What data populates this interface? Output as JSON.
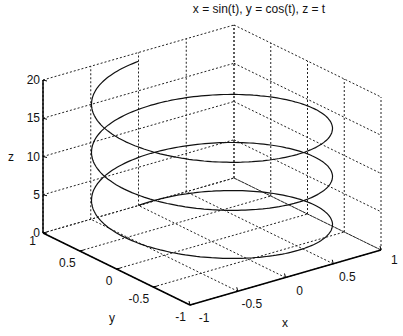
{
  "chart_data": {
    "type": "line3d",
    "title": "x = sin(t), y = cos(t), z = t",
    "xlabel": "x",
    "ylabel": "y",
    "zlabel": "z",
    "xlim": [
      -1,
      1
    ],
    "ylim": [
      -1,
      1
    ],
    "zlim": [
      0,
      20
    ],
    "xticks": [
      -1,
      -0.5,
      0,
      0.5,
      1
    ],
    "yticks": [
      -1,
      -0.5,
      0,
      0.5,
      1
    ],
    "zticks": [
      0,
      5,
      10,
      15,
      20
    ],
    "xtick_labels": [
      "-1",
      "-0.5",
      "0",
      "0.5",
      "1"
    ],
    "ytick_labels": [
      "-1",
      "-0.5",
      "0",
      "0.5",
      "1"
    ],
    "ztick_labels": [
      "0",
      "5",
      "10",
      "15",
      "20"
    ],
    "grid": true,
    "box": false,
    "series": [
      {
        "name": "helix",
        "x_expr": "sin(t)",
        "y_expr": "cos(t)",
        "z_expr": "t",
        "t_range": [
          0,
          18.85
        ],
        "color": "#111111"
      }
    ]
  },
  "colors": {
    "line": "#111111",
    "grid": "#222222",
    "axis": "#000000",
    "background": "#ffffff"
  }
}
